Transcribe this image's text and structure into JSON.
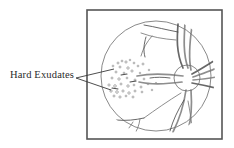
{
  "figure": {
    "annotation_label": "Hard Exudates",
    "colors": {
      "frame_border": "#555555",
      "background": "#ffffff",
      "fundus_outline": "#6b6b6b",
      "vessel": "#7a7a7a",
      "vessel_dark": "#4d4d4d",
      "exudate": "#8c8c8c",
      "leader_line": "#3a3a3a",
      "label_text": "#2b2b2b",
      "optic_disc": "#6b6b6b"
    },
    "frame": {
      "x": 87,
      "y": 10,
      "width": 135,
      "height": 129,
      "stroke_width": 1.6
    },
    "fundus_circle": {
      "cx": 156,
      "cy": 76,
      "r": 55
    },
    "optic_disc": {
      "cx": 187,
      "cy": 78,
      "r": 13,
      "name": "optic-disc"
    },
    "annotation": {
      "text_x": 10,
      "text_y": 69,
      "apex_x": 76,
      "apex_y": 78,
      "leader_lines": [
        {
          "x1": 76,
          "y1": 78,
          "x2": 114,
          "y2": 69
        },
        {
          "x1": 76,
          "y1": 78,
          "x2": 111,
          "y2": 90
        }
      ]
    },
    "vessels": [
      {
        "name": "superior-arcade-main",
        "d": "M 178 24 C 177 38, 176 52, 183 68"
      },
      {
        "name": "superior-arcade-second",
        "d": "M 185 23 C 184 38, 183 54, 188 68"
      },
      {
        "name": "superior-arcade-third",
        "d": "M 192 26 C 190 40, 188 56, 191 70"
      },
      {
        "name": "superior-branch-left",
        "d": "M 178 32 C 167 30, 156 27, 144 25"
      },
      {
        "name": "superior-branch-left-2",
        "d": "M 176 40 C 163 39, 152 37, 141 33"
      },
      {
        "name": "superior-branch-fork",
        "d": "M 152 36 C 147 42, 143 48, 141 56"
      },
      {
        "name": "superior-branch-fork-2",
        "d": "M 146 37 C 144 44, 143 50, 145 57"
      },
      {
        "name": "nasal-horizontal",
        "d": "M 183 76 C 168 74, 152 73, 137 76"
      },
      {
        "name": "nasal-horizontal-2",
        "d": "M 182 82 C 167 84, 152 85, 139 82"
      },
      {
        "name": "temporal-fan-1",
        "d": "M 192 74 C 203 68, 212 62, 220 57"
      },
      {
        "name": "temporal-fan-2",
        "d": "M 193 77 C 204 73, 213 70, 221 66"
      },
      {
        "name": "temporal-fan-3",
        "d": "M 193 80 C 204 79, 213 78, 221 76"
      },
      {
        "name": "temporal-fan-4",
        "d": "M 192 83 C 203 85, 212 87, 220 89"
      },
      {
        "name": "inferior-arcade-main",
        "d": "M 186 90 C 184 104, 180 118, 173 132"
      },
      {
        "name": "inferior-arcade-second",
        "d": "M 191 90 C 192 104, 192 117, 188 130"
      },
      {
        "name": "inferior-branch-v",
        "d": "M 184 100 C 178 110, 173 120, 170 131"
      },
      {
        "name": "inferior-branch-v2",
        "d": "M 188 101 C 190 112, 192 122, 192 131"
      },
      {
        "name": "inferior-left",
        "d": "M 181 93 C 168 101, 155 110, 144 118"
      },
      {
        "name": "inferior-left-lower",
        "d": "M 144 118 C 135 120, 126 121, 116 120"
      },
      {
        "name": "inferior-left-fork",
        "d": "M 140 119 C 139 126, 137 131, 133 136"
      },
      {
        "name": "inferior-left-fork2",
        "d": "M 133 122 C 130 127, 127 131, 123 134"
      },
      {
        "name": "macula-hint",
        "d": "M 170 78 C 163 77, 156 77, 150 78"
      }
    ],
    "exudates": [
      {
        "cx": 118,
        "cy": 63,
        "r": 1.0
      },
      {
        "cx": 122,
        "cy": 61,
        "r": 0.9
      },
      {
        "cx": 126,
        "cy": 62,
        "r": 1.1
      },
      {
        "cx": 130,
        "cy": 60,
        "r": 0.8
      },
      {
        "cx": 134,
        "cy": 63,
        "r": 0.9
      },
      {
        "cx": 113,
        "cy": 66,
        "r": 0.9
      },
      {
        "cx": 120,
        "cy": 67,
        "r": 1.0
      },
      {
        "cx": 128,
        "cy": 68,
        "r": 1.2
      },
      {
        "cx": 138,
        "cy": 66,
        "r": 0.9
      },
      {
        "cx": 143,
        "cy": 64,
        "r": 1.0
      },
      {
        "cx": 116,
        "cy": 72,
        "r": 1.0
      },
      {
        "cx": 124,
        "cy": 73,
        "r": 0.9
      },
      {
        "cx": 132,
        "cy": 71,
        "r": 1.1
      },
      {
        "cx": 140,
        "cy": 73,
        "r": 0.8
      },
      {
        "cx": 112,
        "cy": 78,
        "r": 1.0
      },
      {
        "cx": 119,
        "cy": 79,
        "r": 1.2
      },
      {
        "cx": 127,
        "cy": 78,
        "r": 0.9
      },
      {
        "cx": 135,
        "cy": 80,
        "r": 1.0
      },
      {
        "cx": 144,
        "cy": 79,
        "r": 0.9
      },
      {
        "cx": 109,
        "cy": 85,
        "r": 1.1
      },
      {
        "cx": 115,
        "cy": 86,
        "r": 1.3
      },
      {
        "cx": 121,
        "cy": 84,
        "r": 1.0
      },
      {
        "cx": 128,
        "cy": 86,
        "r": 1.2
      },
      {
        "cx": 134,
        "cy": 85,
        "r": 0.9
      },
      {
        "cx": 141,
        "cy": 87,
        "r": 1.0
      },
      {
        "cx": 148,
        "cy": 84,
        "r": 0.8
      },
      {
        "cx": 111,
        "cy": 91,
        "r": 1.2
      },
      {
        "cx": 117,
        "cy": 92,
        "r": 1.3
      },
      {
        "cx": 123,
        "cy": 91,
        "r": 1.1
      },
      {
        "cx": 129,
        "cy": 93,
        "r": 1.2
      },
      {
        "cx": 135,
        "cy": 91,
        "r": 1.0
      },
      {
        "cx": 142,
        "cy": 92,
        "r": 0.9
      },
      {
        "cx": 114,
        "cy": 96,
        "r": 1.0
      },
      {
        "cx": 120,
        "cy": 97,
        "r": 1.1
      },
      {
        "cx": 126,
        "cy": 96,
        "r": 0.9
      },
      {
        "cx": 133,
        "cy": 97,
        "r": 1.0
      },
      {
        "cx": 152,
        "cy": 90,
        "r": 0.8
      },
      {
        "cx": 156,
        "cy": 83,
        "r": 0.7
      },
      {
        "cx": 149,
        "cy": 70,
        "r": 0.8
      }
    ],
    "exudate_streaks": [
      {
        "x1": 121,
        "y1": 75,
        "x2": 127,
        "y2": 74
      },
      {
        "x1": 130,
        "y1": 82,
        "x2": 136,
        "y2": 81
      },
      {
        "x1": 112,
        "y1": 88,
        "x2": 118,
        "y2": 89
      }
    ]
  }
}
